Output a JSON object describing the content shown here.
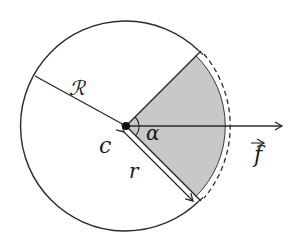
{
  "diagram": {
    "title": "",
    "type": "circle-sector-geometry",
    "labels": {
      "big_radius": "ℛ",
      "center": "c",
      "angle": "α",
      "small_radius": "r",
      "force": "f"
    },
    "colors": {
      "stroke": "#2a2a2a",
      "sector_fill": "#c8c8c8",
      "background": "#ffffff"
    },
    "geometry": {
      "center": [
        126,
        126
      ],
      "circle_radius": 105,
      "dashed_arc_radius": 113,
      "sector_half_angle_deg": 45,
      "force_arrow_end": [
        283,
        126
      ]
    }
  }
}
